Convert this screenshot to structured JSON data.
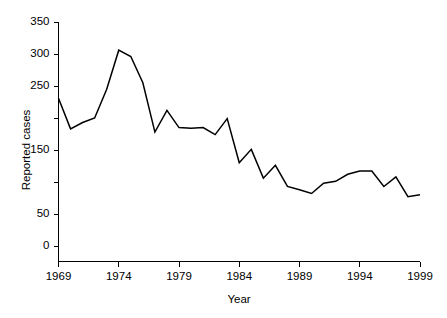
{
  "chart_data": {
    "type": "line",
    "title": "",
    "subtitle": "",
    "xlabel": "Year",
    "ylabel": "Reported cases",
    "xlim": [
      1969,
      1999
    ],
    "ylim": [
      0,
      350
    ],
    "grid": false,
    "legend": false,
    "legend_position": "none",
    "line_color": "#000000",
    "background_color": "#ffffff",
    "x_tick_labels": [
      "1969",
      "1974",
      "1979",
      "1984",
      "1989",
      "1994",
      "1999"
    ],
    "x_tick_values": [
      1969,
      1974,
      1979,
      1984,
      1989,
      1994,
      1999
    ],
    "x_minor_tick_interval": 1,
    "y_tick_labels": [
      "0",
      "50",
      "150",
      "250",
      "300",
      "350"
    ],
    "y_tick_values": [
      0,
      50,
      150,
      250,
      300,
      350
    ],
    "y_unlabeled_tick_values": [
      100,
      200
    ],
    "x": [
      1969,
      1970,
      1971,
      1972,
      1973,
      1974,
      1975,
      1976,
      1977,
      1978,
      1979,
      1980,
      1981,
      1982,
      1983,
      1984,
      1985,
      1986,
      1987,
      1988,
      1989,
      1990,
      1991,
      1992,
      1993,
      1994,
      1995,
      1996,
      1997,
      1998,
      1999
    ],
    "categories": [
      "1969",
      "1970",
      "1971",
      "1972",
      "1973",
      "1974",
      "1975",
      "1976",
      "1977",
      "1978",
      "1979",
      "1980",
      "1981",
      "1982",
      "1983",
      "1984",
      "1985",
      "1986",
      "1987",
      "1988",
      "1989",
      "1990",
      "1991",
      "1992",
      "1993",
      "1994",
      "1995",
      "1996",
      "1997",
      "1998",
      "1999"
    ],
    "values": [
      231,
      183,
      193,
      200,
      245,
      306,
      296,
      255,
      178,
      212,
      185,
      184,
      185,
      174,
      199,
      130,
      151,
      106,
      126,
      93,
      88,
      82,
      98,
      101,
      112,
      117,
      117,
      93,
      108,
      77,
      80
    ],
    "series": [
      {
        "name": "Reported cases",
        "color": "#000000",
        "values": [
          231,
          183,
          193,
          200,
          245,
          306,
          296,
          255,
          178,
          212,
          185,
          184,
          185,
          174,
          199,
          130,
          151,
          106,
          126,
          93,
          88,
          82,
          98,
          101,
          112,
          117,
          117,
          93,
          108,
          77,
          80
        ]
      }
    ],
    "annotations": []
  },
  "axes": {
    "y_title": "Reported cases",
    "x_title": "Year"
  }
}
